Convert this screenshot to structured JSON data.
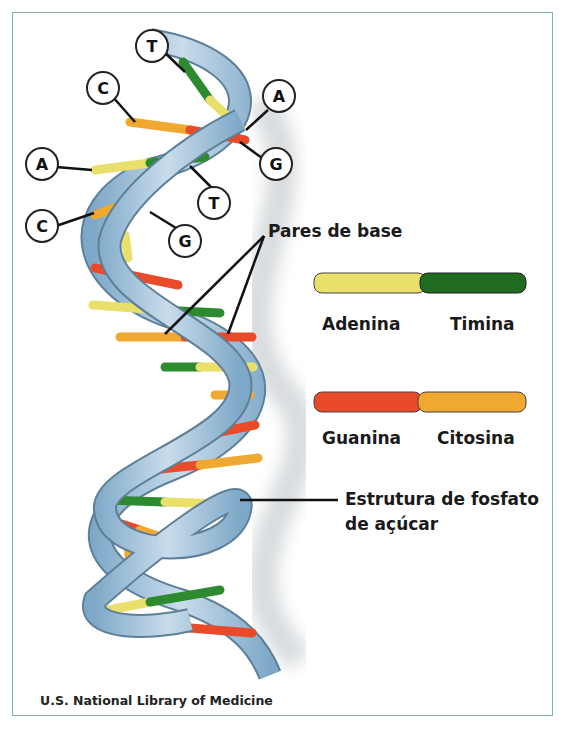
{
  "diagram": {
    "title_labels": {
      "base_pairs": "Pares de base",
      "backbone_line1": "Estrutura de fosfato",
      "backbone_line2": "de açúcar"
    },
    "legend": [
      {
        "left": "Adenina",
        "right": "Timina",
        "left_color": "#e8e06a",
        "right_color": "#1f6b1f"
      },
      {
        "left": "Guanina",
        "right": "Citosina",
        "left_color": "#e84a2a",
        "right_color": "#f0a830"
      }
    ],
    "base_callouts": [
      "T",
      "C",
      "A",
      "A",
      "G",
      "T",
      "C",
      "G"
    ],
    "credit": "U.S. National Library of Medicine",
    "colors": {
      "backbone": "#9cc3dd",
      "frame": "#7fb5a3",
      "adenine": "#e8e06a",
      "thymine": "#2e8a2e",
      "guanine": "#e84a2a",
      "cytosine": "#f0a830"
    }
  }
}
